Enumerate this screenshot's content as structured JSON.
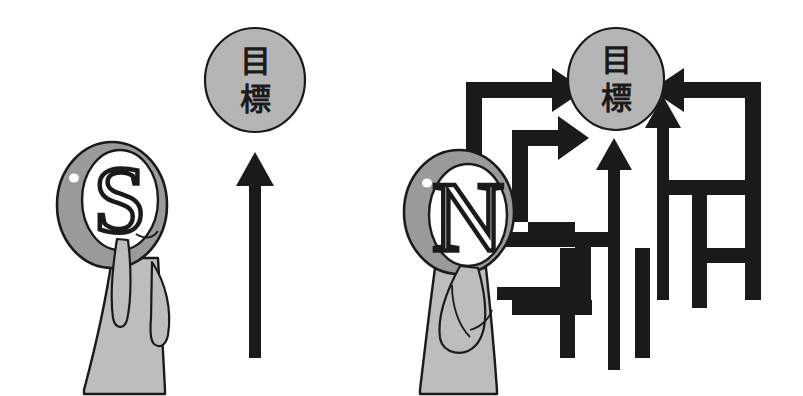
{
  "scene": {
    "title": "Goal approach comparison illustration",
    "background_color": "#ffffff",
    "ink_color": "#1a1a1a",
    "head_fill": "#9a9a9a",
    "body_fill": "#bdbdbd",
    "goal_fill": "#b5b5b5",
    "face_fill": "#ffffff"
  },
  "left_panel": {
    "name": "direct-path-panel",
    "goal": {
      "label_chars": [
        "目",
        "標"
      ],
      "label": "目標"
    },
    "person": {
      "head_letter": "S",
      "description": "person labelled S"
    },
    "path": {
      "kind": "single-straight-arrow",
      "count": 1,
      "direction": "up"
    }
  },
  "right_panel": {
    "name": "maze-path-panel",
    "goal": {
      "label_chars": [
        "目",
        "標"
      ],
      "label": "目標"
    },
    "person": {
      "head_letter": "N",
      "description": "person labelled N"
    },
    "path": {
      "kind": "multi-branching-arrows",
      "count": 4,
      "directions": [
        "right",
        "right",
        "up",
        "left"
      ]
    }
  }
}
